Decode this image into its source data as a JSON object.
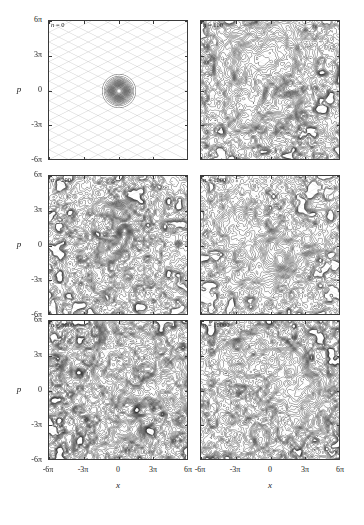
{
  "figure": {
    "type": "phase-space-contour-grid",
    "rows": 3,
    "cols": 2,
    "background": "#ffffff",
    "contour_color": "#2b2b2b",
    "grid_color": "#b9b9b9"
  },
  "axes": {
    "x": {
      "name": "x",
      "ticks": [
        "-6π",
        "-3π",
        "0",
        "3π",
        "6π"
      ],
      "tick_values": [
        -6,
        -3,
        0,
        3,
        6
      ],
      "range": [
        -7.5,
        7.5
      ],
      "unit": "pi"
    },
    "y": {
      "name": "p",
      "ticks": [
        "6π",
        "3π",
        "0",
        "-3π",
        "-6π"
      ],
      "tick_values": [
        6,
        3,
        0,
        -3,
        -6
      ],
      "range": [
        -7.5,
        7.5
      ],
      "unit": "pi"
    }
  },
  "panels": [
    {
      "id": "panel-n-0",
      "label_var": "n",
      "label_eq": "=",
      "label_value": "0",
      "label": "n = 0",
      "step": 0,
      "state": "localized",
      "lattice": true,
      "blob_count": 1,
      "seed": 11,
      "density": 0.0,
      "darkness": 0.0
    },
    {
      "id": "panel-n-100",
      "label_var": "n",
      "label_eq": "=",
      "label_value": "100",
      "label": "n = 100",
      "step": 100,
      "state": "spreading",
      "lattice": true,
      "blob_count": 9,
      "seed": 23,
      "density": 0.62,
      "darkness": 0.55
    },
    {
      "id": "panel-n-200",
      "label_var": "n",
      "label_eq": "=",
      "label_value": "200",
      "label": "n = 200",
      "step": 200,
      "state": "spreading",
      "lattice": true,
      "blob_count": 3,
      "seed": 37,
      "density": 0.48,
      "darkness": 0.42
    },
    {
      "id": "panel-n-1000",
      "label_var": "n",
      "label_eq": "=",
      "label_value": "1000",
      "label": "n = 1000",
      "step": 1000,
      "state": "delocalizing",
      "lattice": true,
      "blob_count": 10,
      "seed": 59,
      "density": 0.68,
      "darkness": 0.62
    },
    {
      "id": "panel-n-5000",
      "label_var": "n",
      "label_eq": "=",
      "label_value": "5000",
      "label": "n = 5000",
      "step": 5000,
      "state": "delocalized",
      "lattice": true,
      "blob_count": 16,
      "seed": 71,
      "density": 0.86,
      "darkness": 0.78
    },
    {
      "id": "panel-n-10000",
      "label_var": "n",
      "label_eq": "=",
      "label_value": "10000",
      "label": "n = 10000",
      "step": 10000,
      "state": "delocalized",
      "lattice": true,
      "blob_count": 17,
      "seed": 89,
      "density": 0.88,
      "darkness": 0.8
    }
  ],
  "chart_data": {
    "type": "contour",
    "title": "",
    "xlabel": "x",
    "ylabel": "p",
    "xlim": [
      -7.5,
      7.5
    ],
    "ylim": [
      -7.5,
      7.5
    ],
    "xticks": [
      -6,
      -3,
      0,
      3,
      6
    ],
    "yticks": [
      -6,
      -3,
      0,
      3,
      6
    ],
    "xticklabels": [
      "-6π",
      "-3π",
      "0",
      "3π",
      "6π"
    ],
    "yticklabels": [
      "-6π",
      "-3π",
      "0",
      "3π",
      "6π"
    ],
    "grid": false,
    "legend": false,
    "panel_labels": [
      "n = 0",
      "n = 100",
      "n = 200",
      "n = 1000",
      "n = 5000",
      "n = 10000"
    ],
    "series": [
      {
        "name": "n = 0",
        "step": 0,
        "spread": 0.05,
        "peak_count": 1
      },
      {
        "name": "n = 100",
        "step": 100,
        "spread": 0.62,
        "peak_count": 9
      },
      {
        "name": "n = 200",
        "step": 200,
        "spread": 0.48,
        "peak_count": 3
      },
      {
        "name": "n = 1000",
        "step": 1000,
        "spread": 0.68,
        "peak_count": 10
      },
      {
        "name": "n = 5000",
        "step": 5000,
        "spread": 0.86,
        "peak_count": 16
      },
      {
        "name": "n = 10000",
        "step": 10000,
        "spread": 0.88,
        "peak_count": 17
      }
    ]
  }
}
